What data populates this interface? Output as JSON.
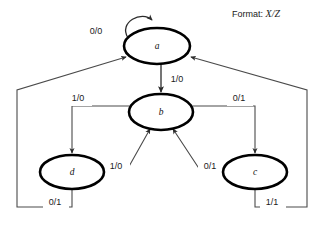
{
  "diagram": {
    "type": "mealy-state-transition-diagram",
    "legend": {
      "prefix": "Format:",
      "expression": "X/Z"
    },
    "states": [
      {
        "id": "a",
        "label": "a",
        "cx": 157,
        "cy": 46,
        "rx": 33,
        "ry": 18
      },
      {
        "id": "b",
        "label": "b",
        "cx": 161,
        "cy": 112,
        "rx": 32,
        "ry": 18
      },
      {
        "id": "d",
        "label": "d",
        "cx": 72,
        "cy": 172,
        "rx": 32,
        "ry": 17
      },
      {
        "id": "c",
        "label": "c",
        "cx": 255,
        "cy": 172,
        "rx": 32,
        "ry": 17
      }
    ],
    "transitions": [
      {
        "name": "a-to-a-self-loop",
        "from": "a",
        "to": "a",
        "input": "0",
        "output": "0",
        "label": "0/0",
        "label_x": 96,
        "label_y": 32
      },
      {
        "name": "a-to-b",
        "from": "a",
        "to": "b",
        "input": "1",
        "output": "0",
        "label": "1/0",
        "label_x": 177,
        "label_y": 80
      },
      {
        "name": "b-to-d",
        "from": "b",
        "to": "d",
        "input": "1",
        "output": "0",
        "label": "1/0",
        "label_x": 78,
        "label_y": 99
      },
      {
        "name": "b-to-c",
        "from": "b",
        "to": "c",
        "input": "0",
        "output": "1",
        "label": "0/1",
        "label_x": 239,
        "label_y": 99
      },
      {
        "name": "d-to-b",
        "from": "d",
        "to": "b",
        "input": "1",
        "output": "0",
        "label": "1/0",
        "label_x": 116,
        "label_y": 167
      },
      {
        "name": "c-to-b",
        "from": "c",
        "to": "b",
        "input": "0",
        "output": "1",
        "label": "0/1",
        "label_x": 210,
        "label_y": 167
      },
      {
        "name": "d-to-a",
        "from": "d",
        "to": "a",
        "input": "0",
        "output": "1",
        "label": "0/1",
        "label_x": 55,
        "label_y": 203
      },
      {
        "name": "c-to-a",
        "from": "c",
        "to": "a",
        "input": "1",
        "output": "1",
        "label": "1/1",
        "label_x": 272,
        "label_y": 203
      }
    ],
    "colors": {
      "background": "#ffffff",
      "state_outline": "#000000",
      "edge": "#4a4a4a",
      "text": "#1a1a1a"
    }
  }
}
